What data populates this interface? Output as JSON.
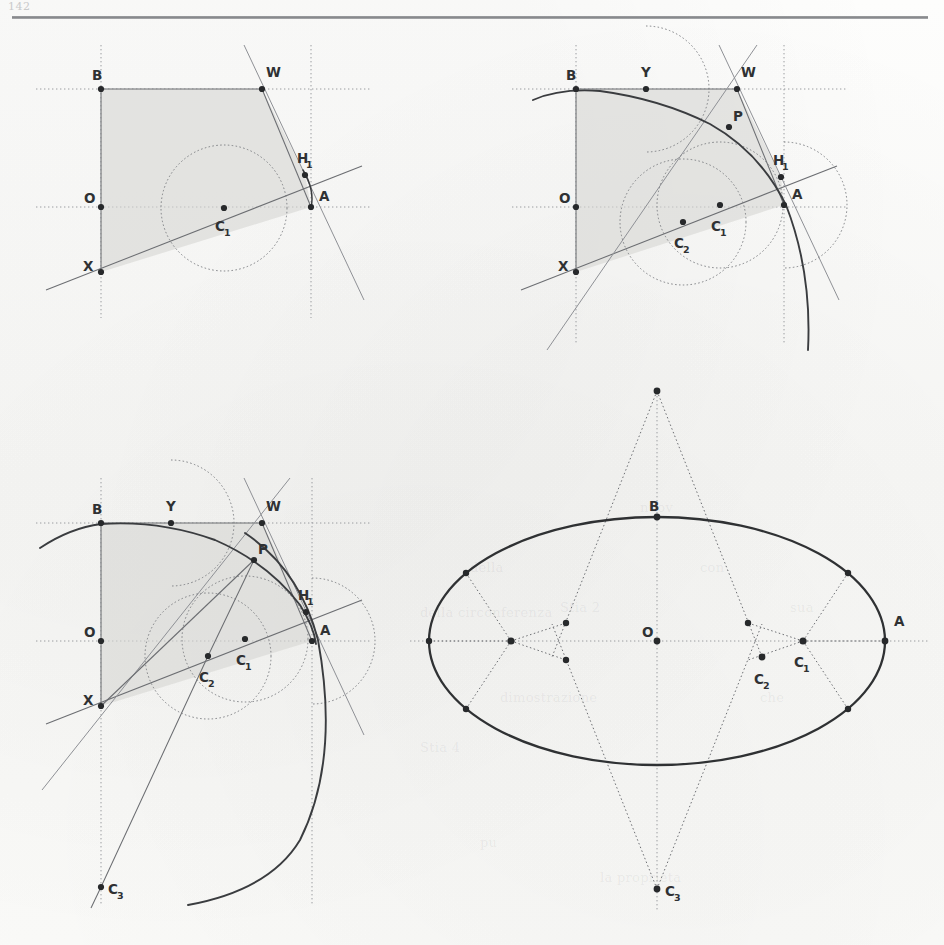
{
  "page": {
    "number": "142",
    "background_hex": "#fbfbfa",
    "ink_hex": "#2f3133",
    "construction_hex": "#6c6e72",
    "shade_hex": "#d6d6d4",
    "rule_hex": "#7b7d80"
  },
  "figure": {
    "panels": [
      {
        "id": "panel-1",
        "name": "stage-1-quarter-frame-and-first-circle",
        "origin": {
          "x": 101,
          "y": 207
        },
        "labels": [
          {
            "text": "B",
            "sub": "",
            "x": 92,
            "y": 76,
            "point": {
              "x": 101,
              "y": 89
            }
          },
          {
            "text": "W",
            "sub": "",
            "x": 266,
            "y": 72,
            "point": {
              "x": 262,
              "y": 89
            }
          },
          {
            "text": "H",
            "sub": "1",
            "x": 300,
            "y": 160,
            "point": {
              "x": 305,
              "y": 175
            }
          },
          {
            "text": "A",
            "sub": "",
            "x": 318,
            "y": 196,
            "point": {
              "x": 311,
              "y": 207
            }
          },
          {
            "text": "O",
            "sub": "",
            "x": 86,
            "y": 198,
            "point": {
              "x": 101,
              "y": 207
            }
          },
          {
            "text": "C",
            "sub": "1",
            "x": 218,
            "y": 226,
            "point": {
              "x": 224,
              "y": 208
            }
          },
          {
            "text": "X",
            "sub": "",
            "x": 85,
            "y": 266,
            "point": {
              "x": 101,
              "y": 272
            }
          }
        ],
        "circles": [
          {
            "name": "circle-c1",
            "cx": 224,
            "cy": 208,
            "r": 63,
            "style": "dotted"
          }
        ],
        "shaded_region": "B-W-H1-A-X-O quadrilateral fan"
      },
      {
        "id": "panel-2",
        "name": "stage-2-add-second-circle-and-arc",
        "origin": {
          "x": 576,
          "y": 207
        },
        "labels": [
          {
            "text": "B",
            "sub": "",
            "x": 566,
            "y": 76,
            "point": {
              "x": 576,
              "y": 89
            }
          },
          {
            "text": "Y",
            "sub": "",
            "x": 643,
            "y": 72,
            "point": {
              "x": 646,
              "y": 89
            }
          },
          {
            "text": "W",
            "sub": "",
            "x": 741,
            "y": 72,
            "point": {
              "x": 737,
              "y": 89
            }
          },
          {
            "text": "P",
            "sub": "",
            "x": 732,
            "y": 116,
            "point": {
              "x": 729,
              "y": 127
            }
          },
          {
            "text": "H",
            "sub": "1",
            "x": 776,
            "y": 162,
            "point": {
              "x": 781,
              "y": 177
            }
          },
          {
            "text": "A",
            "sub": "",
            "x": 791,
            "y": 196,
            "point": {
              "x": 784,
              "y": 205
            }
          },
          {
            "text": "O",
            "sub": "",
            "x": 561,
            "y": 198,
            "point": {
              "x": 576,
              "y": 207
            }
          },
          {
            "text": "C",
            "sub": "1",
            "x": 714,
            "y": 226,
            "point": {
              "x": 720,
              "y": 205
            }
          },
          {
            "text": "C",
            "sub": "2",
            "x": 677,
            "y": 243,
            "point": {
              "x": 683,
              "y": 222
            }
          },
          {
            "text": "X",
            "sub": "",
            "x": 560,
            "y": 266,
            "point": {
              "x": 576,
              "y": 272
            }
          }
        ],
        "circles": [
          {
            "name": "circle-c1",
            "cx": 720,
            "cy": 205,
            "r": 63,
            "style": "dotted"
          },
          {
            "name": "circle-c2",
            "cx": 683,
            "cy": 222,
            "r": 63,
            "style": "dotted"
          },
          {
            "name": "arc-y",
            "cx": 646,
            "cy": 89,
            "r": 63,
            "style": "dotted"
          },
          {
            "name": "arc-w",
            "cx": 784,
            "cy": 205,
            "r": 63,
            "style": "dotted"
          }
        ]
      },
      {
        "id": "panel-3",
        "name": "stage-3-add-third-centre-and-full-conic",
        "origin": {
          "x": 101,
          "y": 641
        },
        "labels": [
          {
            "text": "B",
            "sub": "",
            "x": 92,
            "y": 510,
            "point": {
              "x": 101,
              "y": 523
            }
          },
          {
            "text": "Y",
            "sub": "",
            "x": 168,
            "y": 506,
            "point": {
              "x": 171,
              "y": 523
            }
          },
          {
            "text": "W",
            "sub": "",
            "x": 266,
            "y": 506,
            "point": {
              "x": 262,
              "y": 523
            }
          },
          {
            "text": "P",
            "sub": "",
            "x": 257,
            "y": 549,
            "point": {
              "x": 254,
              "y": 560
            }
          },
          {
            "text": "H",
            "sub": "1",
            "x": 301,
            "y": 597,
            "point": {
              "x": 306,
              "y": 612
            }
          },
          {
            "text": "A",
            "sub": "",
            "x": 318,
            "y": 630,
            "point": {
              "x": 312,
              "y": 641
            }
          },
          {
            "text": "O",
            "sub": "",
            "x": 86,
            "y": 632,
            "point": {
              "x": 101,
              "y": 641
            }
          },
          {
            "text": "C",
            "sub": "1",
            "x": 239,
            "y": 660,
            "point": {
              "x": 245,
              "y": 639
            }
          },
          {
            "text": "C",
            "sub": "2",
            "x": 202,
            "y": 677,
            "point": {
              "x": 208,
              "y": 656
            }
          },
          {
            "text": "X",
            "sub": "",
            "x": 85,
            "y": 700,
            "point": {
              "x": 101,
              "y": 706
            }
          },
          {
            "text": "C",
            "sub": "3",
            "x": 108,
            "y": 894,
            "point": {
              "x": 101,
              "y": 887
            }
          }
        ],
        "circles": [
          {
            "name": "circle-c1",
            "cx": 245,
            "cy": 639,
            "r": 63,
            "style": "dotted"
          },
          {
            "name": "circle-c2",
            "cx": 208,
            "cy": 656,
            "r": 63,
            "style": "dotted"
          },
          {
            "name": "arc-y",
            "cx": 171,
            "cy": 523,
            "r": 63,
            "style": "dotted"
          },
          {
            "name": "arc-w",
            "cx": 312,
            "cy": 641,
            "r": 63,
            "style": "dotted"
          }
        ]
      },
      {
        "id": "panel-4",
        "name": "stage-4-completed-ellipse-with-radiating-construction",
        "ellipse": {
          "cx": 657,
          "cy": 641,
          "rx": 228,
          "ry": 124
        },
        "apex_top": {
          "x": 657,
          "y": 391
        },
        "apex_bottom": {
          "x": 657,
          "y": 889
        },
        "labels": [
          {
            "text": "B",
            "sub": "",
            "x": 648,
            "y": 508,
            "point": {
              "x": 657,
              "y": 517
            }
          },
          {
            "text": "O",
            "sub": "",
            "x": 643,
            "y": 631,
            "point": {
              "x": 657,
              "y": 641
            }
          },
          {
            "text": "A",
            "sub": "",
            "x": 893,
            "y": 621,
            "point": {
              "x": 885,
              "y": 641
            }
          },
          {
            "text": "C",
            "sub": "1",
            "x": 797,
            "y": 662,
            "point": {
              "x": 803,
              "y": 641
            }
          },
          {
            "text": "C",
            "sub": "2",
            "x": 758,
            "y": 678,
            "point": {
              "x": 762,
              "y": 657
            }
          },
          {
            "text": "C",
            "sub": "3",
            "x": 664,
            "y": 894,
            "point": {
              "x": 657,
              "y": 889
            }
          }
        ]
      }
    ],
    "point_labels_used": [
      "A",
      "B",
      "O",
      "P",
      "W",
      "X",
      "Y",
      "H1",
      "C1",
      "C2",
      "C3"
    ]
  },
  "bleed_text": [
    {
      "text": "nuov",
      "x": 640,
      "y": 500
    },
    {
      "text": "della",
      "x": 470,
      "y": 560
    },
    {
      "text": "della circonferenza",
      "x": 420,
      "y": 605
    },
    {
      "text": "con",
      "x": 700,
      "y": 560
    },
    {
      "text": "sua",
      "x": 790,
      "y": 600
    },
    {
      "text": "dimostrazione",
      "x": 500,
      "y": 690
    },
    {
      "text": "che",
      "x": 760,
      "y": 690
    },
    {
      "text": "Stia 2",
      "x": 560,
      "y": 600
    },
    {
      "text": "Stia 4",
      "x": 420,
      "y": 740
    },
    {
      "text": "la proprieta",
      "x": 600,
      "y": 870
    },
    {
      "text": "pu",
      "x": 480,
      "y": 835
    }
  ]
}
